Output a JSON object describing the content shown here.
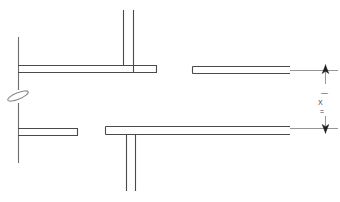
{
  "drawing": {
    "title": "Technical Line Drawing - Sectional Profile",
    "background_color": "#ffffff",
    "line_color": "#3c3c3c",
    "line_color_light": "#8a8a8a",
    "canvas": {
      "width": 340,
      "height": 202
    },
    "dimension": {
      "label": "X",
      "upper_tick": "—",
      "lower_tick": "=",
      "arrow_count": 2,
      "orientation": "vertical",
      "extension_line_x": 325,
      "upper_arrow_y": 70,
      "lower_arrow_y": 128
    },
    "break_symbol": {
      "name": "break-line-symbol",
      "x": 18,
      "y": 96
    },
    "elements": [
      {
        "name": "upper-left-vertical-stem",
        "type": "line",
        "x1": 18,
        "y1": 37,
        "x2": 18,
        "y2": 90
      },
      {
        "name": "lower-left-vertical-stem",
        "type": "line",
        "x1": 18,
        "y1": 103,
        "x2": 18,
        "y2": 163
      },
      {
        "name": "upper-left-flange-band",
        "type": "band",
        "x": 18,
        "y": 65,
        "width": 139,
        "height": 7
      },
      {
        "name": "upper-center-vertical-left",
        "type": "line",
        "x1": 123,
        "y1": 10,
        "x2": 123,
        "y2": 65
      },
      {
        "name": "upper-center-vertical-right",
        "type": "line",
        "x1": 133,
        "y1": 10,
        "x2": 133,
        "y2": 72
      },
      {
        "name": "upper-right-flange-band",
        "type": "band",
        "x": 192,
        "y": 66,
        "width": 98,
        "height": 7
      },
      {
        "name": "lower-left-flange-band",
        "type": "band",
        "x": 18,
        "y": 128,
        "width": 60,
        "height": 7
      },
      {
        "name": "lower-right-flange-band",
        "type": "band",
        "x": 105,
        "y": 126,
        "width": 185,
        "height": 8
      },
      {
        "name": "lower-center-vertical-left",
        "type": "line",
        "x1": 126,
        "y1": 134,
        "x2": 126,
        "y2": 191
      },
      {
        "name": "lower-center-vertical-right",
        "type": "line",
        "x1": 135,
        "y1": 134,
        "x2": 135,
        "y2": 191
      }
    ]
  }
}
